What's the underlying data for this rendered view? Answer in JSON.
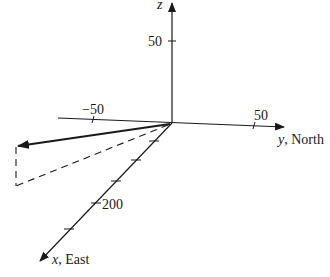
{
  "diagram": {
    "type": "3d-coordinate-axes-vector",
    "colors": {
      "ink": "#1a1a1a",
      "background": "#ffffff"
    },
    "axes": {
      "z": {
        "label": "z",
        "tick_label": "50"
      },
      "y": {
        "label_var": "y",
        "label_dir": ", North",
        "tick_neg": "−50",
        "tick_pos": "50"
      },
      "x": {
        "label_var": "x",
        "label_dir": ", East",
        "tick_label": "200"
      }
    },
    "vector": {
      "style": "solid-bold-arrow"
    },
    "projection": {
      "style": "dashed"
    }
  }
}
